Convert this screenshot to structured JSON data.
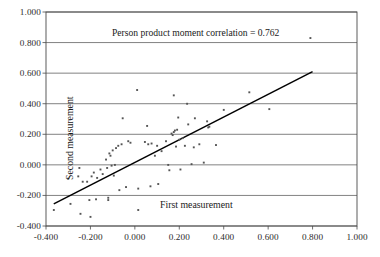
{
  "chart_data": {
    "type": "scatter",
    "title": "",
    "annotation": "Person product moment correlation = 0.762",
    "xlabel": "First measurement",
    "ylabel": "Second measurement",
    "xlim": [
      -0.4,
      1.0
    ],
    "ylim": [
      -0.4,
      1.0
    ],
    "xticks": [
      "-0.400",
      "-0.200",
      "0.000",
      "0.200",
      "0.400",
      "0.600",
      "0.800",
      "1.000"
    ],
    "yticks": [
      "-0.400",
      "-0.200",
      "0.000",
      "0.200",
      "0.400",
      "0.600",
      "0.800",
      "1.000"
    ],
    "xtick_values": [
      -0.4,
      -0.2,
      0.0,
      0.2,
      0.4,
      0.6,
      0.8,
      1.0
    ],
    "ytick_values": [
      -0.4,
      -0.2,
      0.0,
      0.2,
      0.4,
      0.6,
      0.8,
      1.0
    ],
    "grid": "horizontal",
    "legend": "none",
    "marker_color": "#555555",
    "line_color": "#000000",
    "correlation": 0.762,
    "trendline": {
      "x": [
        -0.365,
        0.8
      ],
      "y": [
        -0.255,
        0.61
      ]
    },
    "points": [
      {
        "x": -0.365,
        "y": -0.295
      },
      {
        "x": -0.3,
        "y": -0.09
      },
      {
        "x": -0.29,
        "y": -0.255
      },
      {
        "x": -0.255,
        "y": -0.075
      },
      {
        "x": -0.25,
        "y": -0.02
      },
      {
        "x": -0.245,
        "y": -0.32
      },
      {
        "x": -0.235,
        "y": -0.11
      },
      {
        "x": -0.215,
        "y": -0.11
      },
      {
        "x": -0.205,
        "y": -0.23
      },
      {
        "x": -0.2,
        "y": -0.34
      },
      {
        "x": -0.195,
        "y": -0.075
      },
      {
        "x": -0.185,
        "y": -0.05
      },
      {
        "x": -0.175,
        "y": -0.225
      },
      {
        "x": -0.17,
        "y": -0.085
      },
      {
        "x": -0.155,
        "y": -0.03
      },
      {
        "x": -0.145,
        "y": -0.06
      },
      {
        "x": -0.13,
        "y": 0.035
      },
      {
        "x": -0.125,
        "y": -0.02
      },
      {
        "x": -0.12,
        "y": -0.23
      },
      {
        "x": -0.12,
        "y": -0.215
      },
      {
        "x": -0.115,
        "y": 0.075
      },
      {
        "x": -0.11,
        "y": 0.06
      },
      {
        "x": -0.105,
        "y": -0.005
      },
      {
        "x": -0.1,
        "y": 0.095
      },
      {
        "x": -0.095,
        "y": -0.07
      },
      {
        "x": -0.09,
        "y": 0.0
      },
      {
        "x": -0.085,
        "y": 0.11
      },
      {
        "x": -0.075,
        "y": 0.125
      },
      {
        "x": -0.07,
        "y": -0.165
      },
      {
        "x": -0.06,
        "y": 0.135
      },
      {
        "x": -0.055,
        "y": 0.305
      },
      {
        "x": -0.04,
        "y": -0.145
      },
      {
        "x": -0.03,
        "y": 0.155
      },
      {
        "x": -0.02,
        "y": 0.145
      },
      {
        "x": 0.01,
        "y": 0.49
      },
      {
        "x": 0.015,
        "y": -0.295
      },
      {
        "x": 0.015,
        "y": -0.155
      },
      {
        "x": 0.045,
        "y": 0.15
      },
      {
        "x": 0.055,
        "y": 0.255
      },
      {
        "x": 0.06,
        "y": 0.135
      },
      {
        "x": 0.07,
        "y": -0.14
      },
      {
        "x": 0.075,
        "y": 0.14
      },
      {
        "x": 0.09,
        "y": 0.06
      },
      {
        "x": 0.1,
        "y": 0.125
      },
      {
        "x": 0.105,
        "y": -0.125
      },
      {
        "x": 0.12,
        "y": 0.09
      },
      {
        "x": 0.14,
        "y": 0.155
      },
      {
        "x": 0.15,
        "y": 0.0
      },
      {
        "x": 0.155,
        "y": -0.035
      },
      {
        "x": 0.165,
        "y": 0.205
      },
      {
        "x": 0.17,
        "y": 0.195
      },
      {
        "x": 0.175,
        "y": 0.215
      },
      {
        "x": 0.175,
        "y": 0.455
      },
      {
        "x": 0.18,
        "y": 0.225
      },
      {
        "x": 0.185,
        "y": 0.12
      },
      {
        "x": 0.19,
        "y": 0.23
      },
      {
        "x": 0.195,
        "y": 0.31
      },
      {
        "x": 0.2,
        "y": 0.165
      },
      {
        "x": 0.205,
        "y": -0.03
      },
      {
        "x": 0.215,
        "y": 0.175
      },
      {
        "x": 0.225,
        "y": 0.125
      },
      {
        "x": 0.235,
        "y": 0.4
      },
      {
        "x": 0.24,
        "y": 0.265
      },
      {
        "x": 0.255,
        "y": 0.005
      },
      {
        "x": 0.265,
        "y": 0.115
      },
      {
        "x": 0.27,
        "y": 0.305
      },
      {
        "x": 0.29,
        "y": 0.135
      },
      {
        "x": 0.31,
        "y": 0.015
      },
      {
        "x": 0.325,
        "y": 0.285
      },
      {
        "x": 0.33,
        "y": 0.245
      },
      {
        "x": 0.335,
        "y": 0.25
      },
      {
        "x": 0.365,
        "y": 0.13
      },
      {
        "x": 0.4,
        "y": 0.36
      },
      {
        "x": 0.515,
        "y": 0.475
      },
      {
        "x": 0.605,
        "y": 0.365
      },
      {
        "x": 0.79,
        "y": 0.83
      }
    ]
  },
  "geometry": {
    "plot_left": 46,
    "plot_top": 12,
    "plot_right": 357,
    "plot_bottom": 226
  }
}
